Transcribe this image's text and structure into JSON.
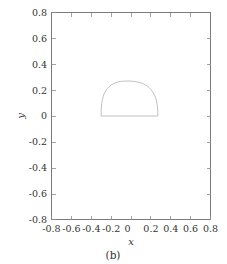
{
  "figure": {
    "caption": "(b)",
    "background_color": "#ffffff",
    "frame_color": "#7b7b7b",
    "curve_color": "#b9b9b9"
  },
  "chart_data": {
    "type": "line",
    "title": "",
    "subtitle": "",
    "xlabel": "x",
    "ylabel": "y",
    "xlim": [
      -0.8,
      0.8
    ],
    "ylim": [
      -0.8,
      0.8
    ],
    "grid": false,
    "legend": null,
    "legend_position": "none",
    "xticks": [
      -0.8,
      -0.6,
      -0.4,
      -0.2,
      0,
      0.2,
      0.4,
      0.6,
      0.8
    ],
    "xticklabels": [
      "-0.8",
      "-0.6",
      "-0.4",
      "-0.2",
      "0",
      "0.2",
      "0.4",
      "0.6",
      "0.8"
    ],
    "yticks": [
      -0.8,
      -0.6,
      -0.4,
      -0.2,
      0,
      0.2,
      0.4,
      0.6,
      0.8
    ],
    "yticklabels": [
      "-0.8",
      "-0.6",
      "-0.4",
      "-0.2",
      "0",
      "0.2",
      "0.4",
      "0.6",
      "0.8"
    ],
    "aspect": "equal",
    "series": [
      {
        "name": "closed-contour",
        "closed": true,
        "comment": "Dome / flat-bottomed closed contour: flat base along y=0 from x=-0.30 to x=0.27, arching to apex y=0.27 near x=-0.01",
        "x": [
          -0.3,
          -0.3,
          -0.298,
          -0.294,
          -0.288,
          -0.279,
          -0.268,
          -0.254,
          -0.238,
          -0.22,
          -0.2,
          -0.178,
          -0.155,
          -0.13,
          -0.104,
          -0.077,
          -0.049,
          -0.02,
          0.009,
          0.038,
          0.066,
          0.093,
          0.119,
          0.143,
          0.165,
          0.185,
          0.203,
          0.219,
          0.234,
          0.246,
          0.256,
          0.263,
          0.268,
          0.27,
          0.27,
          -0.3
        ],
        "y": [
          0.0,
          0.035,
          0.068,
          0.099,
          0.127,
          0.152,
          0.175,
          0.195,
          0.212,
          0.227,
          0.239,
          0.249,
          0.257,
          0.263,
          0.267,
          0.269,
          0.27,
          0.27,
          0.269,
          0.267,
          0.263,
          0.258,
          0.251,
          0.242,
          0.231,
          0.218,
          0.203,
          0.186,
          0.166,
          0.144,
          0.119,
          0.091,
          0.061,
          0.031,
          0.0,
          0.0
        ]
      }
    ]
  }
}
